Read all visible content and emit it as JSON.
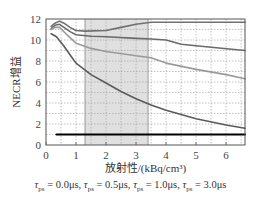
{
  "chart_data": {
    "type": "line",
    "title": "",
    "xlabel": "放射性/(kBq/cm³)",
    "ylabel": "NECR增益",
    "xlim": [
      0,
      6.63
    ],
    "ylim": [
      0,
      12
    ],
    "xticks": [
      0,
      1,
      2,
      3,
      4,
      5,
      6
    ],
    "yticks": [
      0,
      2,
      4,
      6,
      8,
      10,
      12
    ],
    "grid": true,
    "shaded_region": {
      "x_start": 1.3,
      "x_end": 3.4,
      "color": "#e0e0e0"
    },
    "legend_text": "τps = 0.0μs, τps = 0.5μs, τps = 1.0μs, τps = 3.0μs",
    "series": [
      {
        "name": "τps = 0.0μs",
        "color": "#000000",
        "width": 2.2,
        "x": [
          0.35,
          1,
          2,
          3,
          4,
          5,
          6,
          6.63
        ],
        "y": [
          1.0,
          1.0,
          1.0,
          1.0,
          1.0,
          1.0,
          1.0,
          1.0
        ]
      },
      {
        "name": "τps = 0.5μs",
        "color": "#707070",
        "width": 1.6,
        "x": [
          0.17,
          0.3,
          0.45,
          0.6,
          0.8,
          1.0,
          1.3,
          2.0,
          2.5,
          3.0,
          3.5,
          4.5,
          5.5,
          6.63
        ],
        "y": [
          11.3,
          11.6,
          11.8,
          11.6,
          11.2,
          10.9,
          10.85,
          10.9,
          11.2,
          11.5,
          11.7,
          11.7,
          11.7,
          11.7
        ]
      },
      {
        "name": "τps = 1.0μs",
        "color": "#6a6a6a",
        "width": 1.6,
        "x": [
          0.17,
          0.3,
          0.45,
          0.6,
          0.8,
          1.0,
          1.5,
          2.0,
          3.0,
          3.5,
          4.0,
          4.5,
          5.5,
          6.63
        ],
        "y": [
          11.1,
          11.4,
          11.5,
          11.2,
          10.8,
          10.5,
          10.35,
          10.3,
          10.15,
          10.1,
          10.0,
          9.6,
          9.3,
          9.0
        ]
      },
      {
        "name": "τps = 3.0μs",
        "color": "#9a9a9a",
        "width": 1.6,
        "x": [
          0.17,
          0.3,
          0.45,
          0.7,
          1.0,
          1.5,
          2.0,
          3.0,
          3.5,
          4.0,
          5.0,
          6.0,
          6.63
        ],
        "y": [
          11.0,
          11.2,
          11.2,
          10.5,
          9.7,
          9.2,
          8.9,
          8.5,
          8.3,
          7.8,
          7.2,
          6.7,
          6.3
        ]
      },
      {
        "name": "τps = 3.0μs (lowest curve)",
        "color": "#5a5a5a",
        "width": 1.6,
        "x": [
          0.17,
          0.35,
          0.6,
          0.8,
          1.0,
          1.5,
          2.0,
          2.5,
          3.0,
          3.5,
          4.0,
          5.0,
          6.0,
          6.63
        ],
        "y": [
          10.6,
          10.3,
          9.4,
          8.6,
          7.8,
          6.7,
          5.9,
          5.1,
          4.4,
          3.8,
          3.3,
          2.5,
          1.9,
          1.6
        ]
      }
    ]
  },
  "labels": {
    "xlabel": "放射性/(kBq/cm³)",
    "ylabel": "NECR增益",
    "legend_items": [
      {
        "sym": "τ",
        "sub": "ps",
        "val": " = 0.0μs, "
      },
      {
        "sym": "τ",
        "sub": "ps",
        "val": " = 0.5μs, "
      },
      {
        "sym": "τ",
        "sub": "ps",
        "val": " = 1.0μs, "
      },
      {
        "sym": "τ",
        "sub": "ps",
        "val": " = 3.0μs"
      }
    ]
  }
}
